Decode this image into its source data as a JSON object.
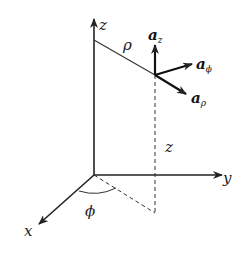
{
  "diagram": {
    "colors": {
      "line": "#222222",
      "background": "#ffffff"
    },
    "axes": {
      "x": {
        "label": "x"
      },
      "y": {
        "label": "y"
      },
      "z": {
        "label": "z"
      }
    },
    "labels": {
      "rho": "ρ",
      "phi": "ϕ",
      "height": "z"
    },
    "unit_vectors": [
      {
        "name": "a",
        "subscript": "z"
      },
      {
        "name": "a",
        "subscript": "ϕ"
      },
      {
        "name": "a",
        "subscript": "ρ"
      }
    ]
  }
}
